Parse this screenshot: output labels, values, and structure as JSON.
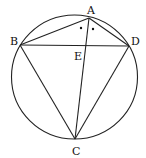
{
  "diagram": {
    "type": "cyclic-quadrilateral",
    "circle": {
      "cx": 74.5,
      "cy": 77,
      "r": 62.5
    },
    "points": {
      "A": {
        "label": "A",
        "x": 89,
        "y": 18
      },
      "B": {
        "label": "B",
        "x": 20,
        "y": 45
      },
      "C": {
        "label": "C",
        "x": 75,
        "y": 139
      },
      "D": {
        "label": "D",
        "x": 129,
        "y": 46
      },
      "E": {
        "label": "E",
        "x": 84,
        "y": 46
      }
    },
    "segments": [
      "AB",
      "AD",
      "BD",
      "BC",
      "DC",
      "AC"
    ],
    "angle_marks": [
      "angle BAE dot",
      "angle EAD dot"
    ]
  }
}
